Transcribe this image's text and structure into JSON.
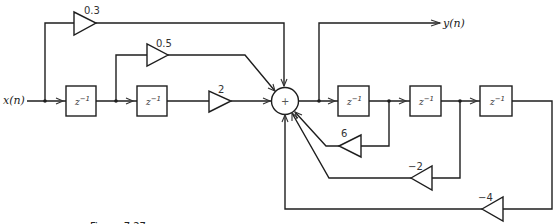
{
  "diagram": {
    "input_label": "x(n)",
    "output_label": "y(n)",
    "summer_symbol": "+",
    "delay_label": {
      "base": "z",
      "exp": "−1"
    },
    "feedforward_gains": [
      "0.3",
      "0.5",
      "2"
    ],
    "feedback_gains": [
      "6",
      "−2",
      "−4"
    ],
    "caption": "Figure 7.27"
  }
}
